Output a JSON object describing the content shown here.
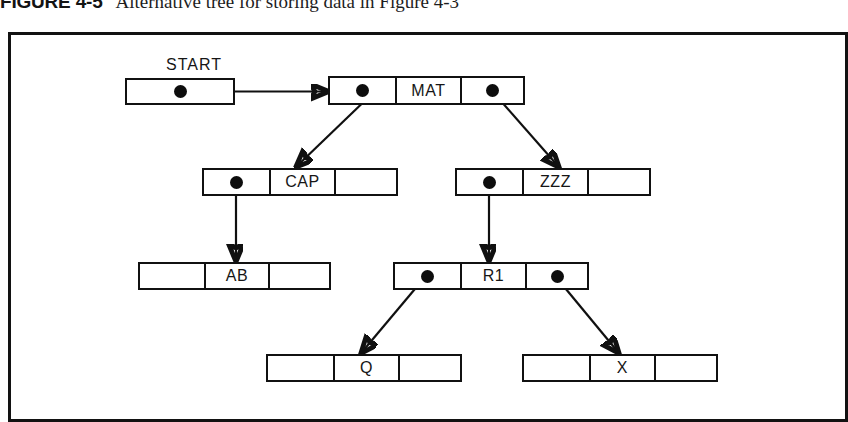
{
  "caption": {
    "figure_label": "FIGURE 4-5",
    "title": "Alternative tree for storing data in Figure 4-3"
  },
  "diagram": {
    "type": "binary-tree-linked-list",
    "labels": {
      "start": "START"
    },
    "nodes": [
      {
        "id": "start",
        "key": "START",
        "cells": [
          "pointer"
        ],
        "value": "",
        "x": 125,
        "y": 78,
        "width": 110,
        "height": 27,
        "cell_count": 1
      },
      {
        "id": "mat",
        "key": "MAT",
        "cells": [
          "pointer",
          "value",
          "pointer"
        ],
        "value": "MAT",
        "x": 328,
        "y": 76,
        "width": 197,
        "height": 29,
        "cell_count": 3
      },
      {
        "id": "cap",
        "key": "CAP",
        "cells": [
          "pointer",
          "value",
          "empty"
        ],
        "value": "CAP",
        "x": 202,
        "y": 168,
        "width": 196,
        "height": 28,
        "cell_count": 3
      },
      {
        "id": "zzz",
        "key": "ZZZ",
        "cells": [
          "pointer",
          "value",
          "empty"
        ],
        "value": "ZZZ",
        "x": 455,
        "y": 168,
        "width": 196,
        "height": 28,
        "cell_count": 3
      },
      {
        "id": "ab",
        "key": "AB",
        "cells": [
          "empty",
          "value",
          "empty"
        ],
        "value": "AB",
        "x": 138,
        "y": 262,
        "width": 193,
        "height": 28,
        "cell_count": 3
      },
      {
        "id": "r1",
        "key": "R1",
        "cells": [
          "pointer",
          "value",
          "pointer"
        ],
        "value": "R1",
        "x": 393,
        "y": 262,
        "width": 196,
        "height": 28,
        "cell_count": 3
      },
      {
        "id": "q",
        "key": "Q",
        "cells": [
          "empty",
          "value",
          "empty"
        ],
        "value": "Q",
        "x": 266,
        "y": 354,
        "width": 196,
        "height": 28,
        "cell_count": 3
      },
      {
        "id": "x",
        "key": "X",
        "cells": [
          "empty",
          "value",
          "empty"
        ],
        "value": "X",
        "x": 522,
        "y": 354,
        "width": 196,
        "height": 28,
        "cell_count": 3
      }
    ],
    "edges": [
      {
        "from": "start",
        "from_cell": 0,
        "to": "mat",
        "to_cell": 0,
        "style": "horizontal"
      },
      {
        "from": "mat",
        "from_cell": 0,
        "to": "cap",
        "to_cell": 1,
        "style": "diagonal-left"
      },
      {
        "from": "mat",
        "from_cell": 2,
        "to": "zzz",
        "to_cell": 1,
        "style": "diagonal-right"
      },
      {
        "from": "cap",
        "from_cell": 0,
        "to": "ab",
        "to_cell": 1,
        "style": "vertical"
      },
      {
        "from": "zzz",
        "from_cell": 0,
        "to": "r1",
        "to_cell": 1,
        "style": "vertical"
      },
      {
        "from": "r1",
        "from_cell": 0,
        "to": "q",
        "to_cell": 1,
        "style": "diagonal-left"
      },
      {
        "from": "r1",
        "from_cell": 2,
        "to": "x",
        "to_cell": 1,
        "style": "diagonal-right"
      }
    ],
    "colors": {
      "ink": "#111111",
      "paper": "#ffffff"
    }
  }
}
